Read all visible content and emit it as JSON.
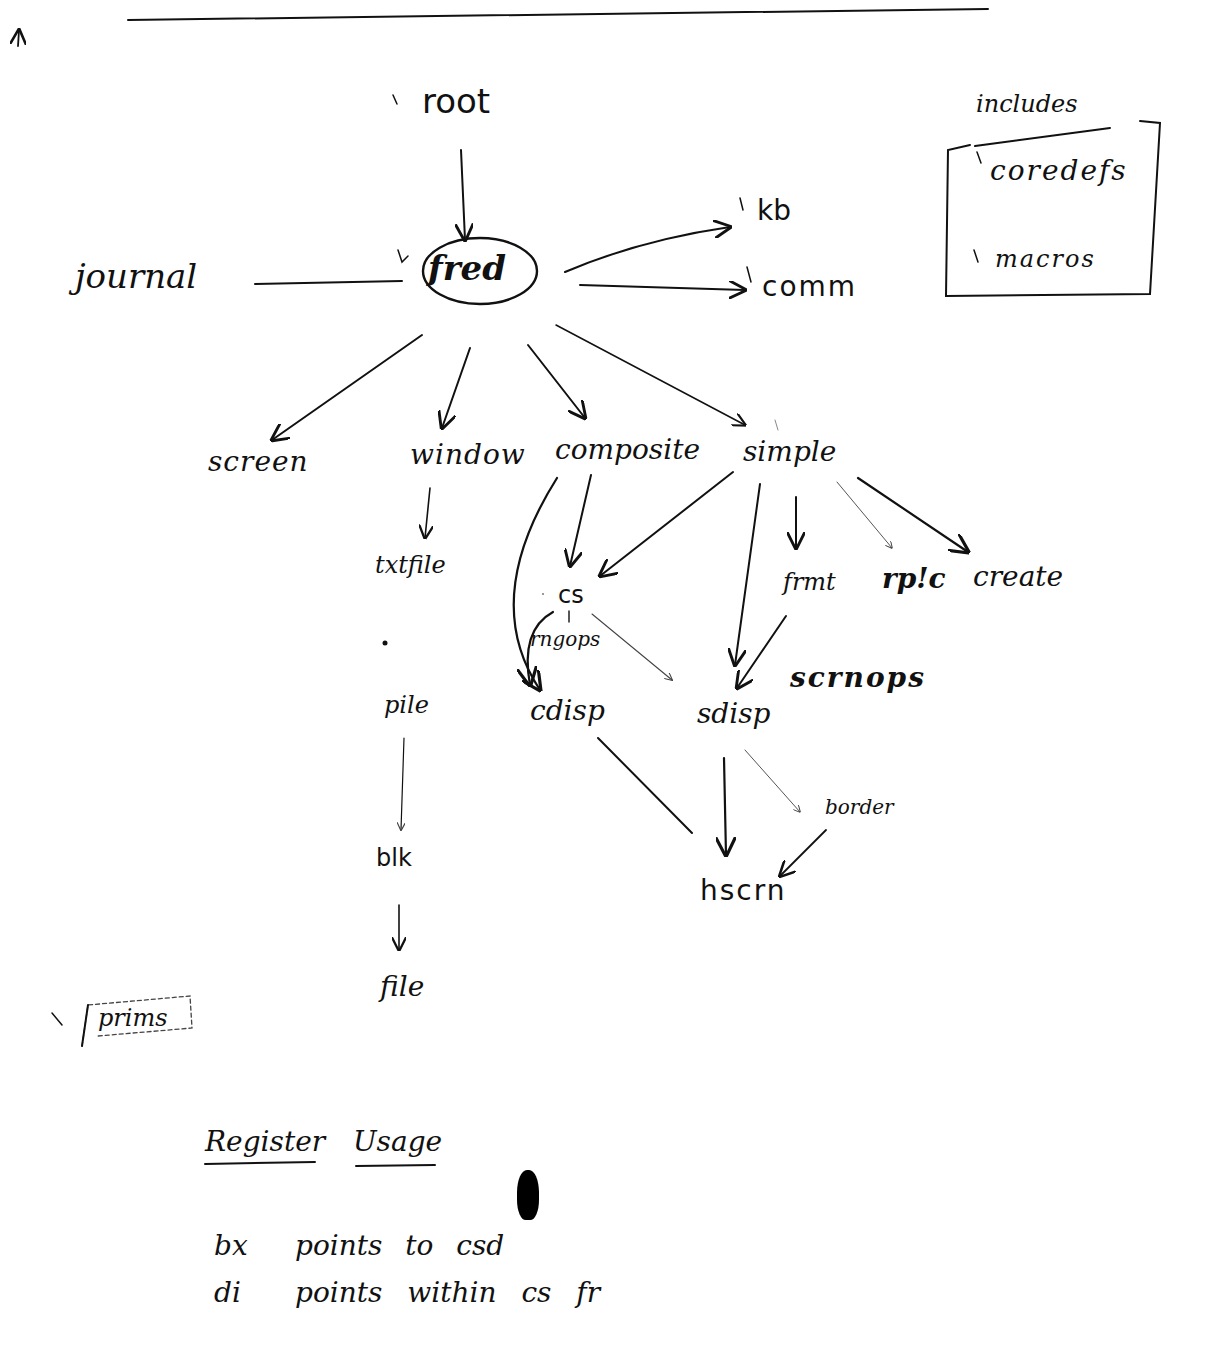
{
  "diagram": {
    "top_rule": true,
    "corner_mark": "↑",
    "nodes": {
      "root": "root",
      "fred": "fred",
      "journal": "journal",
      "kb": "kb",
      "comm": "comm",
      "screen": "screen",
      "window": "window",
      "composite": "composite",
      "simple": "simple",
      "txtfile": "txtfile",
      "pile": "pile",
      "blk": "blk",
      "file": "file",
      "cs": "cs",
      "rngops": "rngops",
      "cdisp": "cdisp",
      "sdisp": "sdisp",
      "frmt": "frmt",
      "rplc": "rp!c",
      "create": "create",
      "scrnops": "scrnops",
      "border": "border",
      "hscrn": "hscrn",
      "prims": "prims"
    },
    "includes": {
      "title": "includes",
      "items": [
        "coredefs",
        "macros"
      ]
    },
    "checkmark": "\\",
    "edges": [
      {
        "from": "root",
        "to": "fred"
      },
      {
        "from": "journal",
        "to": "fred",
        "style": "line"
      },
      {
        "from": "fred",
        "to": "kb"
      },
      {
        "from": "fred",
        "to": "comm"
      },
      {
        "from": "fred",
        "to": "screen"
      },
      {
        "from": "fred",
        "to": "window"
      },
      {
        "from": "fred",
        "to": "composite"
      },
      {
        "from": "fred",
        "to": "simple"
      },
      {
        "from": "window",
        "to": "txtfile"
      },
      {
        "from": "pile",
        "to": "blk"
      },
      {
        "from": "blk",
        "to": "file"
      },
      {
        "from": "composite",
        "to": "cs"
      },
      {
        "from": "composite",
        "to": "cdisp"
      },
      {
        "from": "simple",
        "to": "cs"
      },
      {
        "from": "simple",
        "to": "sdisp"
      },
      {
        "from": "simple",
        "to": "frmt"
      },
      {
        "from": "simple",
        "to": "rp!c"
      },
      {
        "from": "simple",
        "to": "create"
      },
      {
        "from": "cs",
        "to": "cdisp"
      },
      {
        "from": "cs",
        "to": "sdisp"
      },
      {
        "from": "frmt",
        "to": "sdisp"
      },
      {
        "from": "cdisp",
        "to": "hscrn",
        "style": "line"
      },
      {
        "from": "sdisp",
        "to": "hscrn"
      },
      {
        "from": "sdisp",
        "to": "border"
      },
      {
        "from": "border",
        "to": "hscrn"
      }
    ]
  },
  "register_usage": {
    "title_word1": "Register",
    "title_word2": "Usage",
    "rows": [
      {
        "reg": "bx",
        "desc": "points to csd"
      },
      {
        "reg": "di",
        "desc": "points within cs fr"
      }
    ]
  }
}
